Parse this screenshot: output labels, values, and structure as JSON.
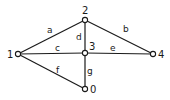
{
  "diagram": {
    "type": "graph",
    "nodes": [
      {
        "id": "1",
        "label": "1",
        "x": 18,
        "y": 54,
        "label_x": 7,
        "label_y": 58
      },
      {
        "id": "2",
        "label": "2",
        "x": 85,
        "y": 20,
        "label_x": 82,
        "label_y": 14
      },
      {
        "id": "3",
        "label": "3",
        "x": 85,
        "y": 53,
        "label_x": 89,
        "label_y": 50
      },
      {
        "id": "4",
        "label": "4",
        "x": 153,
        "y": 54,
        "label_x": 158,
        "label_y": 58
      },
      {
        "id": "0",
        "label": "0",
        "x": 85,
        "y": 89,
        "label_x": 90,
        "label_y": 93
      }
    ],
    "edges": [
      {
        "id": "a",
        "label": "a",
        "from": "1",
        "to": "2",
        "label_x": 47,
        "label_y": 33
      },
      {
        "id": "b",
        "label": "b",
        "from": "2",
        "to": "4",
        "label_x": 123,
        "label_y": 32
      },
      {
        "id": "d",
        "label": "d",
        "from": "2",
        "to": "3",
        "label_x": 76,
        "label_y": 40
      },
      {
        "id": "c",
        "label": "c",
        "from": "1",
        "to": "3",
        "label_x": 55,
        "label_y": 51
      },
      {
        "id": "e",
        "label": "e",
        "from": "3",
        "to": "4",
        "label_x": 110,
        "label_y": 51
      },
      {
        "id": "f",
        "label": "f",
        "from": "1",
        "to": "0",
        "label_x": 56,
        "label_y": 73
      },
      {
        "id": "g",
        "label": "g",
        "from": "3",
        "to": "0",
        "label_x": 87,
        "label_y": 74
      }
    ]
  }
}
